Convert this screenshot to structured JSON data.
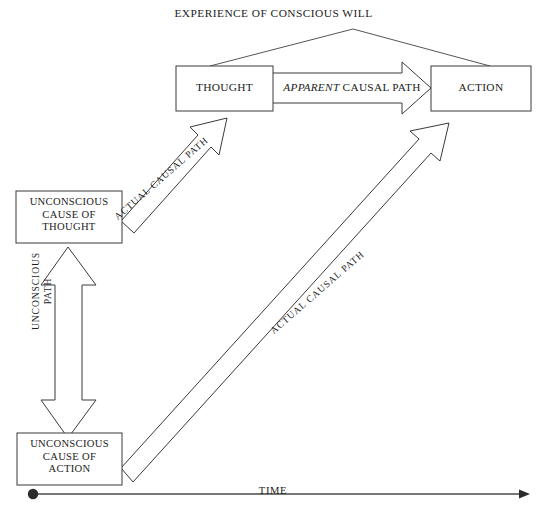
{
  "diagram": {
    "title": "EXPERIENCE OF CONSCIOUS WILL",
    "nodes": {
      "thought": "THOUGHT",
      "action": "ACTION",
      "unconscious_cause_of_thought": "UNCONSCIOUS\nCAUSE OF\nTHOUGHT",
      "unconscious_cause_of_action": "UNCONSCIOUS\nCAUSE OF\nACTION"
    },
    "edges": {
      "apparent_emphasis": "APPARENT",
      "apparent_rest": " CAUSAL PATH",
      "actual_path_thought": "ACTUAL CAUSAL PATH",
      "actual_path_action": "ACTUAL CAUSAL PATH",
      "unconscious_path": "UNCONSCIOUS\nPATH"
    },
    "axis": {
      "label": "TIME"
    },
    "colors": {
      "stroke": "#3a3a3a",
      "thin_stroke": "#555555",
      "text": "#1c1c1c",
      "background": "#ffffff"
    }
  }
}
